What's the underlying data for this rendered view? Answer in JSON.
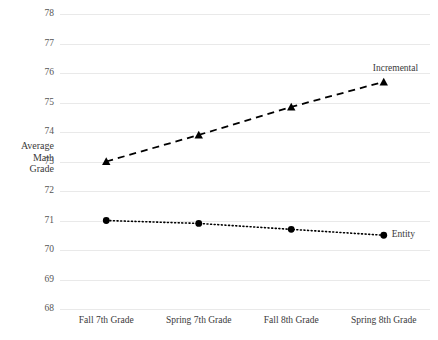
{
  "chart_data": {
    "type": "line",
    "title": "",
    "xlabel": "",
    "ylabel": "Average Math Grade",
    "ylabel_lines": [
      "Average",
      "Math",
      "Grade"
    ],
    "categories": [
      "Fall 7th Grade",
      "Spring 7th Grade",
      "Fall 8th Grade",
      "Spring 8th Grade"
    ],
    "ylim": [
      68,
      78
    ],
    "yticks": [
      78,
      77,
      76,
      75,
      74,
      73,
      72,
      71,
      70,
      69,
      68
    ],
    "grid": "horizontal",
    "legend_position": "inline-right-of-series",
    "series": [
      {
        "name": "Incremental",
        "values": [
          73.0,
          73.9,
          74.85,
          75.7
        ],
        "line_style": "dashed",
        "marker": "triangle",
        "color": "#000000"
      },
      {
        "name": "Entity",
        "values": [
          71.0,
          70.9,
          70.7,
          70.5
        ],
        "line_style": "dotted",
        "marker": "circle",
        "color": "#000000"
      }
    ]
  },
  "colors": {
    "background": "#ffffff",
    "gridline": "#e9e9e9",
    "text": "#3a3a3a",
    "series": "#000000"
  }
}
